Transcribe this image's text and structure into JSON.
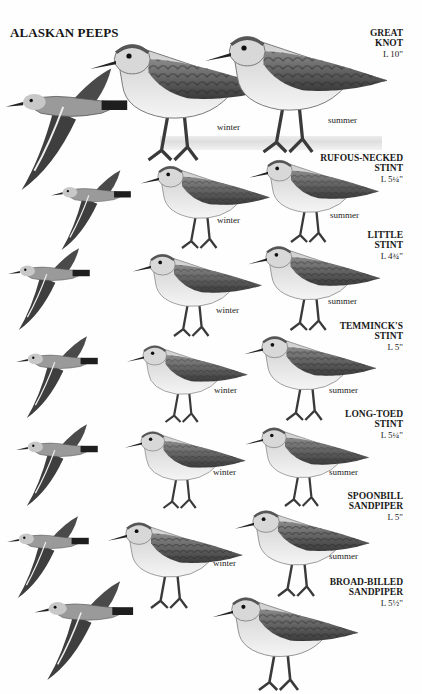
{
  "plate": {
    "title": "ALASKAN PEEPS"
  },
  "species": [
    {
      "name_lines": [
        "GREAT",
        "KNOT"
      ],
      "length": "L 10\"",
      "seasons": [
        "winter",
        "summer"
      ]
    },
    {
      "name_lines": [
        "RUFOUS-NECKED",
        "STINT"
      ],
      "length": "L 5¼\"",
      "seasons": [
        "winter",
        "summer"
      ]
    },
    {
      "name_lines": [
        "LITTLE",
        "STINT"
      ],
      "length": "L 4¾\"",
      "seasons": [
        "winter",
        "summer"
      ]
    },
    {
      "name_lines": [
        "TEMMINCK'S",
        "STINT"
      ],
      "length": "L 5\"",
      "seasons": [
        "winter",
        "summer"
      ]
    },
    {
      "name_lines": [
        "LONG-TOED",
        "STINT"
      ],
      "length": "L 5¼\"",
      "seasons": [
        "winter",
        "summer"
      ]
    },
    {
      "name_lines": [
        "SPOONBILL",
        "SANDPIPER"
      ],
      "length": "L 5\"",
      "seasons": [
        "winter",
        "summer"
      ]
    },
    {
      "name_lines": [
        "BROAD-BILLED",
        "SANDPIPER"
      ],
      "length": "L 5½\"",
      "seasons": []
    }
  ],
  "illustrations": {
    "standing_bird_icon": "sandpiper-standing-illustration",
    "flying_bird_icon": "sandpiper-flying-illustration",
    "colors": {
      "ink_dark": "#1e1e1e",
      "plumage_mid": "#6b6b6b",
      "plumage_light": "#b9b9b9",
      "belly": "#f4f4f4"
    }
  }
}
